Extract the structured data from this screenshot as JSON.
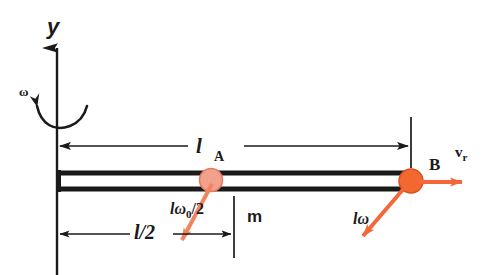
{
  "diagram": {
    "axis_label_y": "y",
    "angular_velocity_symbol": "ω",
    "labels": {
      "length_main": "l",
      "length_main_subscript": "A",
      "point_b": "B",
      "relative_velocity": "v",
      "relative_velocity_subscript": "r",
      "bead_mass": "m",
      "half_length": "l/2",
      "tangential_velocity_bead": "lω",
      "tangential_velocity_bead_sub": "0",
      "tangential_velocity_bead_tail": "/2",
      "tangential_velocity_end": "lω"
    },
    "colors": {
      "line": "#1a1a1a",
      "bead_a_fill": "#f2a18c",
      "bead_a_stroke": "#e8795c",
      "bead_b_fill": "#f2682f",
      "bead_b_stroke": "#d9501c",
      "vector_orange": "#f4673a",
      "vector_orange_light": "#f2845f",
      "background": "#ffffff"
    },
    "geometry": {
      "axis_x": 57,
      "rod_left_x": 57,
      "rod_right_x": 411,
      "rod_top_y": 172,
      "rod_bottom_y": 189,
      "bead_a_x": 211,
      "bead_a_y": 180,
      "bead_b_x": 411,
      "bead_b_y": 181,
      "dim_main_y": 146,
      "dim_half_y": 234
    }
  }
}
